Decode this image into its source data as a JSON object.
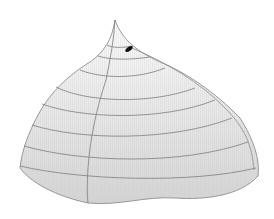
{
  "diagram": {
    "type": "3d-surface-illustration",
    "colors": {
      "background": "#ffffff",
      "surface_top": "#fbfbfb",
      "surface_bottom": "#d6d6d6",
      "outline": "#8a8a8a",
      "contour": "#7d7d7d",
      "marker": "#111111"
    },
    "contour_count": 7,
    "marker": {
      "shape": "ellipse",
      "label": ""
    }
  }
}
